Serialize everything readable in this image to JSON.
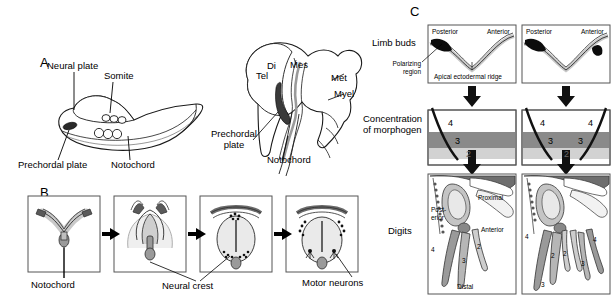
{
  "figure": {
    "panels": {
      "a": {
        "letter": "A",
        "embryo_labels": {
          "neural_plate": "Neural plate",
          "somite": "Somite",
          "prechordal_plate": "Prechordal plate",
          "notochord": "Notochord"
        },
        "brain_labels": {
          "tel": "Tel",
          "di": "Di",
          "mes": "Mes",
          "met": "Met",
          "myel": "Myel",
          "prechordal_plate": "Prechordal\nplate",
          "notochord": "Notochord"
        }
      },
      "b": {
        "letter": "B",
        "labels": {
          "notochord": "Notochord",
          "neural_crest": "Neural crest",
          "motor_neurons": "Motor neurons"
        },
        "stages": [
          {
            "name": "neural-plate-stage"
          },
          {
            "name": "neural-fold-stage"
          },
          {
            "name": "neural-tube-closing-stage"
          },
          {
            "name": "neural-tube-closed-stage"
          }
        ]
      },
      "c": {
        "letter": "C",
        "row_labels": {
          "limb_buds": "Limb buds",
          "polarizing_region": "Polarizing\nregion",
          "concentration_of_morphogen": "Concentration\nof morphogen",
          "digits": "Digits"
        },
        "limb_bud": {
          "posterior": "Posterior",
          "anterior": "Anterior",
          "apical_ectodermal_ridge": "Apical ectodermal ridge"
        },
        "morphogen": {
          "left_digits": [
            "4",
            "3",
            "2"
          ],
          "right_digits": [
            "4",
            "3",
            "2",
            "3",
            "4"
          ]
        },
        "skeleton_left": {
          "posterior": "Post-\nerior",
          "anterior": "Anterior",
          "proximal": "Proximal",
          "distal": "Distal",
          "digits": [
            "4",
            "3",
            "2"
          ]
        },
        "skeleton_right": {
          "digits": [
            "4",
            "2",
            "2",
            "3",
            "4",
            "3"
          ]
        }
      }
    },
    "colors": {
      "ink": "#000000",
      "band_dark": "#8a8a8a",
      "band_light": "#d2d2d2",
      "tissue_light": "#e9e9e9",
      "tissue_mid": "#b9b9b9",
      "tissue_dark": "#6e6e6e",
      "frame": "#555555"
    }
  }
}
